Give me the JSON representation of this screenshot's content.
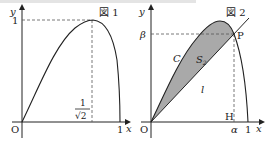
{
  "figure1": {
    "title": "図 1",
    "axis_x_label": "x",
    "axis_y_label": "y",
    "origin_label": "O",
    "x_tick_one": "1",
    "y_tick_one": "1",
    "peak_x_numerator": "1",
    "peak_x_denominator": "√2"
  },
  "figure2": {
    "title": "図 2",
    "axis_x_label": "x",
    "axis_y_label": "y",
    "origin_label": "O",
    "x_tick_one": "1",
    "point_label": "P",
    "foot_label": "H",
    "alpha_label": "α",
    "beta_label": "β",
    "curve_label": "C",
    "line_label": "l",
    "area_label_main": "S",
    "area_label_sub": "2"
  },
  "colors": {
    "line": "#222222",
    "shade": "#a9a9a9",
    "dash": "#555555"
  }
}
